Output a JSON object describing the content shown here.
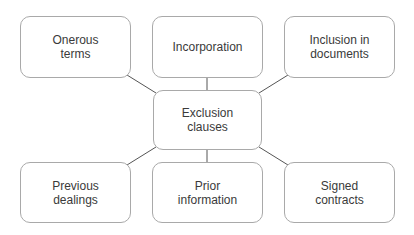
{
  "diagram": {
    "center": {
      "label": "Exclusion clauses"
    },
    "nodes": [
      {
        "id": "onerous-terms",
        "label": "Onerous\nterms"
      },
      {
        "id": "incorporation",
        "label": "Incorporation"
      },
      {
        "id": "inclusion-in-documents",
        "label": "Inclusion in\ndocuments"
      },
      {
        "id": "previous-dealings",
        "label": "Previous\ndealings"
      },
      {
        "id": "prior-information",
        "label": "Prior\ninformation"
      },
      {
        "id": "signed-contracts",
        "label": "Signed\ncontracts"
      }
    ],
    "edges": [
      [
        "Exclusion clauses",
        "Onerous terms"
      ],
      [
        "Exclusion clauses",
        "Incorporation"
      ],
      [
        "Exclusion clauses",
        "Inclusion in documents"
      ],
      [
        "Exclusion clauses",
        "Previous dealings"
      ],
      [
        "Exclusion clauses",
        "Prior information"
      ],
      [
        "Exclusion clauses",
        "Signed contracts"
      ]
    ],
    "colors": {
      "border": "#a9a9a9",
      "line": "#555555",
      "text": "#3a3a3a",
      "background": "#ffffff"
    }
  }
}
